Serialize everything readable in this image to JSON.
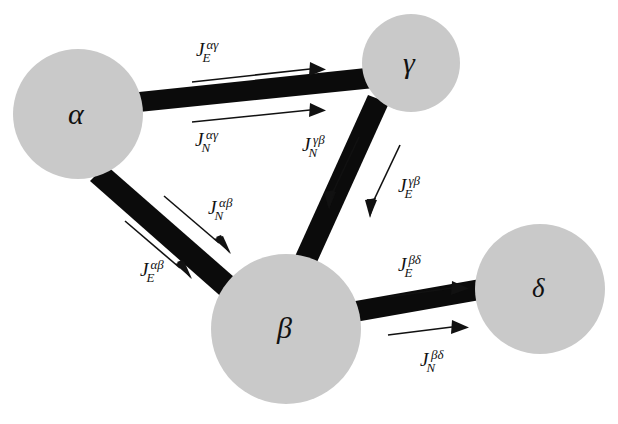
{
  "figure": {
    "type": "network-flux-diagram",
    "background_color": "#ffffff",
    "node_fill_color": "#c9c9c9",
    "bond_color": "#0b0b0b",
    "arrow_color": "#111111",
    "width": 618,
    "height": 424
  },
  "nodes": [
    {
      "id": "alpha",
      "label": "α",
      "cx": 78,
      "cy": 114,
      "r": 65
    },
    {
      "id": "gamma",
      "label": "γ",
      "cx": 411,
      "cy": 63,
      "r": 49
    },
    {
      "id": "beta",
      "label": "β",
      "cx": 286,
      "cy": 329,
      "r": 75
    },
    {
      "id": "delta",
      "label": "δ",
      "cx": 540,
      "cy": 289,
      "r": 65
    }
  ],
  "bonds": [
    {
      "id": "alpha-gamma",
      "from": "alpha",
      "to": "gamma"
    },
    {
      "id": "alpha-beta",
      "from": "alpha",
      "to": "beta"
    },
    {
      "id": "gamma-beta",
      "from": "gamma",
      "to": "beta"
    },
    {
      "id": "beta-delta",
      "from": "beta",
      "to": "delta"
    }
  ],
  "flux_labels": [
    {
      "id": "JE-alpha-gamma",
      "symbol": "J",
      "subscript": "E",
      "superscript": "αγ",
      "bond": "alpha-gamma",
      "side": "above"
    },
    {
      "id": "JN-alpha-gamma",
      "symbol": "J",
      "subscript": "N",
      "superscript": "αγ",
      "bond": "alpha-gamma",
      "side": "below"
    },
    {
      "id": "JN-alpha-beta",
      "symbol": "J",
      "subscript": "N",
      "superscript": "αβ",
      "bond": "alpha-beta",
      "side": "upper-right"
    },
    {
      "id": "JE-alpha-beta",
      "symbol": "J",
      "subscript": "E",
      "superscript": "αβ",
      "bond": "alpha-beta",
      "side": "lower-left"
    },
    {
      "id": "JN-gamma-beta",
      "symbol": "J",
      "subscript": "N",
      "superscript": "γβ",
      "bond": "gamma-beta",
      "side": "left"
    },
    {
      "id": "JE-gamma-beta",
      "symbol": "J",
      "subscript": "E",
      "superscript": "γβ",
      "bond": "gamma-beta",
      "side": "right"
    },
    {
      "id": "JE-beta-delta",
      "symbol": "J",
      "subscript": "E",
      "superscript": "βδ",
      "bond": "beta-delta",
      "side": "above"
    },
    {
      "id": "JN-beta-delta",
      "symbol": "J",
      "subscript": "N",
      "superscript": "βδ",
      "bond": "beta-delta",
      "side": "below"
    }
  ],
  "flux_arrows": [
    {
      "id": "arrow-JE-alpha-gamma",
      "direction": "alpha-to-gamma"
    },
    {
      "id": "arrow-JN-alpha-gamma",
      "direction": "alpha-to-gamma"
    },
    {
      "id": "arrow-JN-alpha-beta",
      "direction": "alpha-to-beta"
    },
    {
      "id": "arrow-JE-alpha-beta",
      "direction": "alpha-to-beta"
    },
    {
      "id": "arrow-JN-gamma-beta",
      "direction": "gamma-to-beta"
    },
    {
      "id": "arrow-JE-gamma-beta",
      "direction": "gamma-to-beta"
    },
    {
      "id": "arrow-JE-beta-delta",
      "direction": "beta-to-delta"
    },
    {
      "id": "arrow-JN-beta-delta",
      "direction": "beta-to-delta"
    }
  ]
}
